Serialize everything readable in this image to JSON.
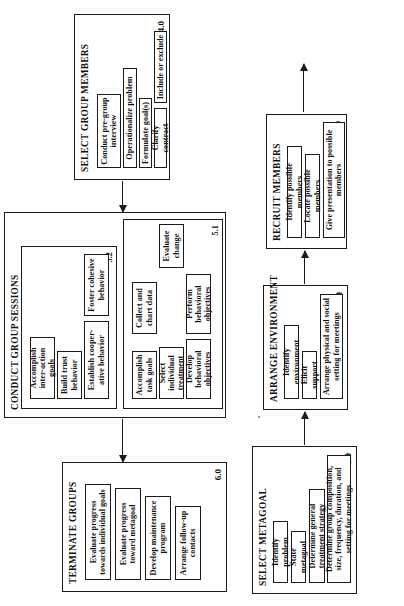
{
  "diagram": {
    "orientation": "rotated-90-ccw",
    "boxes": [
      {
        "id": "1.0",
        "title": "SELECT METAGOAL",
        "number": "1.0",
        "items": [
          "Identify problem",
          "State metagoal",
          "Determine general treatment strategy",
          "Determine group composition, size, frequency, duration, and setting for meetings"
        ]
      },
      {
        "id": "2.0",
        "title": "ARRANGE ENVIRONMENT",
        "number": "2.0",
        "items": [
          "Identify environment",
          "Elicit support",
          "Arrange physical and social setting for meetings"
        ]
      },
      {
        "id": "3.0",
        "title": "RECRUIT MEMBERS",
        "number": "3.0",
        "items": [
          "Identify possible members",
          "Locate possible members",
          "Give presentation to possible members"
        ]
      },
      {
        "id": "4.0",
        "title": "SELECT GROUP MEMBERS",
        "number": "4.0",
        "items": [
          "Conduct pre-group interview",
          "Operationalize problem",
          "Formulate goal(s)",
          "Clarify contract",
          "Include or exclude"
        ]
      },
      {
        "id": "5.0",
        "title": "CONDUCT GROUP SESSIONS",
        "number": "5.0",
        "subgroups": [
          {
            "id": "5.1",
            "number": "5.1",
            "items": [
              "Accomplish task goals",
              "Select individual treatment",
              "Develop behavioral objectives",
              "Perform behavioral objectives",
              "Collect and chart data",
              "Evaluate change"
            ]
          },
          {
            "id": "5.2",
            "number": "5.2",
            "items": [
              "Accomplish inter-action goals",
              "Build trust behavior",
              "Establish cooper-ative behavior",
              "Foster cohesive behavior"
            ]
          }
        ]
      },
      {
        "id": "6.0",
        "title": "TERMINATE GROUPS",
        "number": "6.0",
        "items": [
          "Evaluate progress towards individual goals",
          "Evaluate progress toward metagoal",
          "Develop maintenance program",
          "Arrange follow-up contacts"
        ]
      }
    ],
    "connectors": [
      {
        "from": "1.0",
        "to": "2.0",
        "direction": "right"
      },
      {
        "from": "2.0",
        "to": "3.0",
        "direction": "right"
      },
      {
        "from": "3.0",
        "to": "4.0",
        "direction": "right"
      },
      {
        "from": "4.0",
        "to": "5.0",
        "direction": "right"
      },
      {
        "from": "5.0",
        "to": "6.0",
        "direction": "right"
      }
    ],
    "colors": {
      "ink": "#1a1a1a",
      "paper": "#ffffff"
    }
  }
}
